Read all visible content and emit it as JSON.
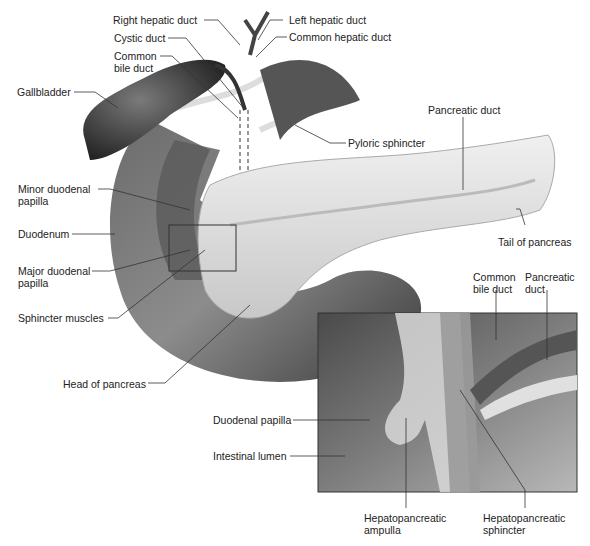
{
  "diagram": {
    "labels": {
      "right_hepatic_duct": "Right hepatic duct",
      "left_hepatic_duct": "Left hepatic duct",
      "cystic_duct": "Cystic duct",
      "common_hepatic_duct": "Common hepatic duct",
      "common_bile_duct": "Common\nbile duct",
      "gallbladder": "Gallbladder",
      "pancreatic_duct": "Pancreatic duct",
      "pyloric_sphincter": "Pyloric sphincter",
      "minor_duodenal_papilla": "Minor duodenal\npapilla",
      "duodenum": "Duodenum",
      "tail_of_pancreas": "Tail of pancreas",
      "major_duodenal_papilla": "Major duodenal\npapilla",
      "sphincter_muscles": "Sphincter muscles",
      "head_of_pancreas": "Head of pancreas"
    },
    "inset": {
      "common_bile_duct": "Common\nbile duct",
      "pancreatic_duct": "Pancreatic\nduct",
      "duodenal_papilla": "Duodenal papilla",
      "intestinal_lumen": "Intestinal lumen",
      "hepatopancreatic_ampulla": "Hepatopancreatic\nampulla",
      "hepatopancreatic_sphincter": "Hepatopancreatic\nsphincter"
    }
  }
}
